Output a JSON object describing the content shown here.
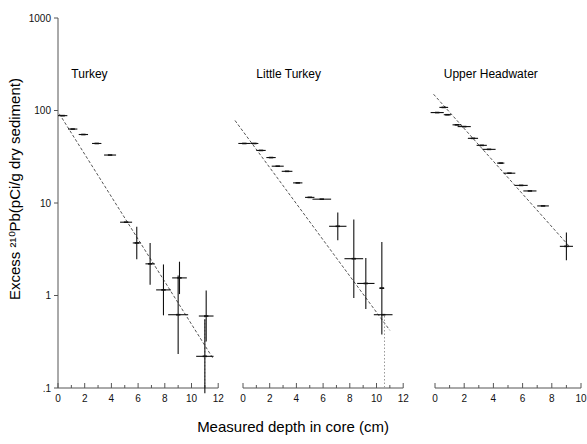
{
  "figure": {
    "width": 587,
    "height": 444,
    "background": "#ffffff",
    "ink": "#111111"
  },
  "chart_data": {
    "type": "scatter",
    "title": "",
    "xlabel": "Measured  depth in core  (cm)",
    "ylabel": "Excess ²¹⁰Pb(pCi/g dry sediment)",
    "yscale": "log",
    "ylim": [
      0.1,
      1000
    ],
    "ytick_labels": [
      "1000",
      "100",
      "10",
      "1",
      ".1"
    ],
    "ytick_values": [
      1000,
      100,
      10,
      1,
      0.1
    ],
    "grid": false,
    "legend": "none",
    "panels": [
      {
        "name": "Turkey",
        "label": "Turkey",
        "xlim": [
          0,
          12
        ],
        "xtick_labels": [
          "0",
          "2",
          "4",
          "6",
          "8",
          "10",
          "12"
        ],
        "xtick_values": [
          0,
          2,
          4,
          6,
          8,
          10,
          12
        ],
        "xtick_minor": [
          1,
          3,
          5,
          7,
          9,
          11
        ],
        "fit_line": {
          "x0": 0.1,
          "y0": 92,
          "x1": 11.6,
          "y1": 0.21
        },
        "divider_x": 11.0,
        "points": [
          {
            "x": 0.35,
            "y": 88,
            "xerr": 0.35,
            "yerr": 0
          },
          {
            "x": 1.1,
            "y": 63,
            "xerr": 0.35,
            "yerr": 0
          },
          {
            "x": 1.9,
            "y": 55,
            "xerr": 0.35,
            "yerr": 0
          },
          {
            "x": 2.9,
            "y": 44,
            "xerr": 0.35,
            "yerr": 0
          },
          {
            "x": 3.9,
            "y": 33,
            "xerr": 0.45,
            "yerr": 0
          },
          {
            "x": 5.1,
            "y": 6.2,
            "xerr": 0.45,
            "yerr": 0
          },
          {
            "x": 5.9,
            "y": 3.7,
            "xerr": 0.3,
            "yerr": 0.35
          },
          {
            "x": 6.9,
            "y": 2.2,
            "xerr": 0.35,
            "yerr": 0.45
          },
          {
            "x": 9.1,
            "y": 1.55,
            "xerr": 0.55,
            "yerr": 0.35
          },
          {
            "x": 7.9,
            "y": 1.15,
            "xerr": 0.55,
            "yerr": 0.55
          },
          {
            "x": 9.0,
            "y": 0.62,
            "xerr": 0.75,
            "yerr": 0.85
          },
          {
            "x": 11.1,
            "y": 0.6,
            "xerr": 0.55,
            "yerr": 0.55
          },
          {
            "x": 11.0,
            "y": 0.22,
            "xerr": 0.65,
            "yerr": 0.8
          }
        ]
      },
      {
        "name": "Little Turkey",
        "label": "Little Turkey",
        "xlim": [
          0,
          12
        ],
        "xtick_labels": [
          "0",
          "2",
          "4",
          "6",
          "8",
          "10",
          "12"
        ],
        "xtick_values": [
          0,
          2,
          4,
          6,
          8,
          10,
          12
        ],
        "xtick_minor": [
          1,
          3,
          5,
          7,
          9,
          11
        ],
        "fit_line": {
          "x0": -0.6,
          "y0": 78,
          "x1": 11.0,
          "y1": 0.42
        },
        "divider_x": 10.6,
        "points": [
          {
            "x": 0.1,
            "y": 44,
            "xerr": 0.45,
            "yerr": 0
          },
          {
            "x": 0.85,
            "y": 44,
            "xerr": 0.3,
            "yerr": 0
          },
          {
            "x": 1.35,
            "y": 37,
            "xerr": 0.35,
            "yerr": 0
          },
          {
            "x": 2.1,
            "y": 31,
            "xerr": 0.35,
            "yerr": 0
          },
          {
            "x": 2.6,
            "y": 25,
            "xerr": 0.45,
            "yerr": 0
          },
          {
            "x": 3.3,
            "y": 22,
            "xerr": 0.4,
            "yerr": 0
          },
          {
            "x": 4.1,
            "y": 16.5,
            "xerr": 0.35,
            "yerr": 0
          },
          {
            "x": 5.0,
            "y": 11.5,
            "xerr": 0.35,
            "yerr": 0
          },
          {
            "x": 5.9,
            "y": 11.0,
            "xerr": 0.7,
            "yerr": 0
          },
          {
            "x": 7.1,
            "y": 5.6,
            "xerr": 0.65,
            "yerr": 0.3
          },
          {
            "x": 8.3,
            "y": 2.5,
            "xerr": 0.7,
            "yerr": 0.85
          },
          {
            "x": 9.2,
            "y": 1.35,
            "xerr": 0.65,
            "yerr": 0.55
          },
          {
            "x": 10.4,
            "y": 1.2,
            "xerr": 0.18,
            "yerr": 1.0
          },
          {
            "x": 10.5,
            "y": 0.62,
            "xerr": 0.7,
            "yerr": 0
          }
        ]
      },
      {
        "name": "Upper Headwater",
        "label": "Upper  Headwater",
        "xlim": [
          0,
          10
        ],
        "xtick_labels": [
          "0",
          "2",
          "4",
          "6",
          "8",
          "10"
        ],
        "xtick_values": [
          0,
          2,
          4,
          6,
          8,
          10
        ],
        "xtick_minor": [
          1,
          3,
          5,
          7,
          9
        ],
        "fit_line": {
          "x0": -0.1,
          "y0": 150,
          "x1": 9.2,
          "y1": 3.4
        },
        "divider_x": null,
        "points": [
          {
            "x": 0.6,
            "y": 108,
            "xerr": 0.3,
            "yerr": 0
          },
          {
            "x": 0.15,
            "y": 95,
            "xerr": 0.45,
            "yerr": 0
          },
          {
            "x": 0.85,
            "y": 90,
            "xerr": 0.25,
            "yerr": 0
          },
          {
            "x": 1.5,
            "y": 70,
            "xerr": 0.3,
            "yerr": 0
          },
          {
            "x": 2.0,
            "y": 67,
            "xerr": 0.45,
            "yerr": 0
          },
          {
            "x": 2.6,
            "y": 50,
            "xerr": 0.35,
            "yerr": 0
          },
          {
            "x": 3.2,
            "y": 42,
            "xerr": 0.35,
            "yerr": 0
          },
          {
            "x": 3.7,
            "y": 38,
            "xerr": 0.45,
            "yerr": 0
          },
          {
            "x": 4.5,
            "y": 27,
            "xerr": 0.25,
            "yerr": 0
          },
          {
            "x": 5.1,
            "y": 21,
            "xerr": 0.4,
            "yerr": 0
          },
          {
            "x": 5.9,
            "y": 15.5,
            "xerr": 0.45,
            "yerr": 0
          },
          {
            "x": 6.5,
            "y": 13.5,
            "xerr": 0.45,
            "yerr": 0
          },
          {
            "x": 7.4,
            "y": 9.3,
            "xerr": 0.4,
            "yerr": 0
          },
          {
            "x": 9.0,
            "y": 3.4,
            "xerr": 0.45,
            "yerr": 0.3
          }
        ]
      }
    ]
  }
}
